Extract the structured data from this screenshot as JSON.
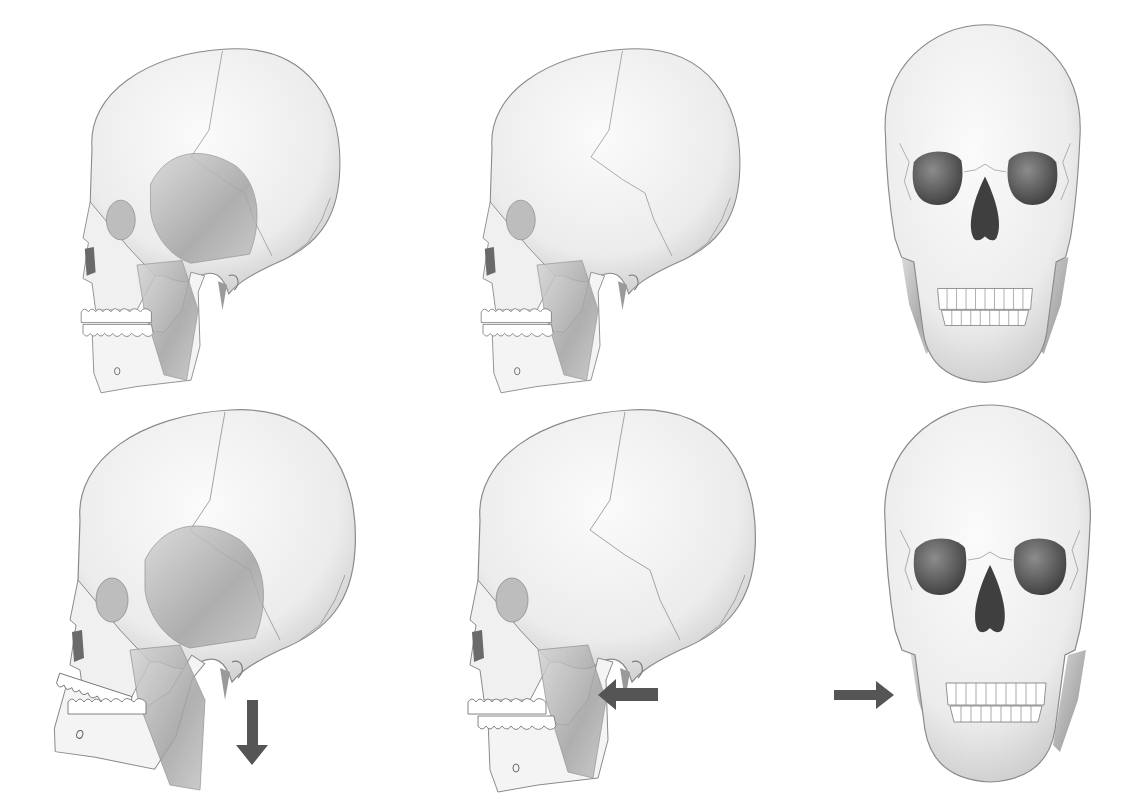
{
  "figure": {
    "background": "#ffffff",
    "colors": {
      "bone": "#f2f2f2",
      "bone_shade": "#cfcfcf",
      "outline": "#8a8a8a",
      "muscle": "#a9a9a9",
      "cavity": "#4a4a4a",
      "arrow": "#555555"
    },
    "panels": [
      {
        "id": "lateral-closed",
        "view": "lateral",
        "jaw": "closed",
        "muscles": [
          "temporalis",
          "masseter"
        ],
        "arrow": null
      },
      {
        "id": "lateral-rest",
        "view": "lateral",
        "jaw": "closed",
        "muscles": [
          "masseter"
        ],
        "arrow": null
      },
      {
        "id": "frontal-closed",
        "view": "frontal",
        "jaw": "closed",
        "muscles": [
          "masseter"
        ],
        "arrow": null
      },
      {
        "id": "lateral-open",
        "view": "lateral",
        "jaw": "depressed",
        "muscles": [
          "temporalis",
          "masseter"
        ],
        "arrow": "down"
      },
      {
        "id": "lateral-retruded",
        "view": "lateral",
        "jaw": "retracted",
        "muscles": [
          "masseter"
        ],
        "arrow": "left"
      },
      {
        "id": "frontal-lateral-shift",
        "view": "frontal",
        "jaw": "shifted-right",
        "muscles": [
          "masseter"
        ],
        "arrow": "right"
      }
    ]
  }
}
